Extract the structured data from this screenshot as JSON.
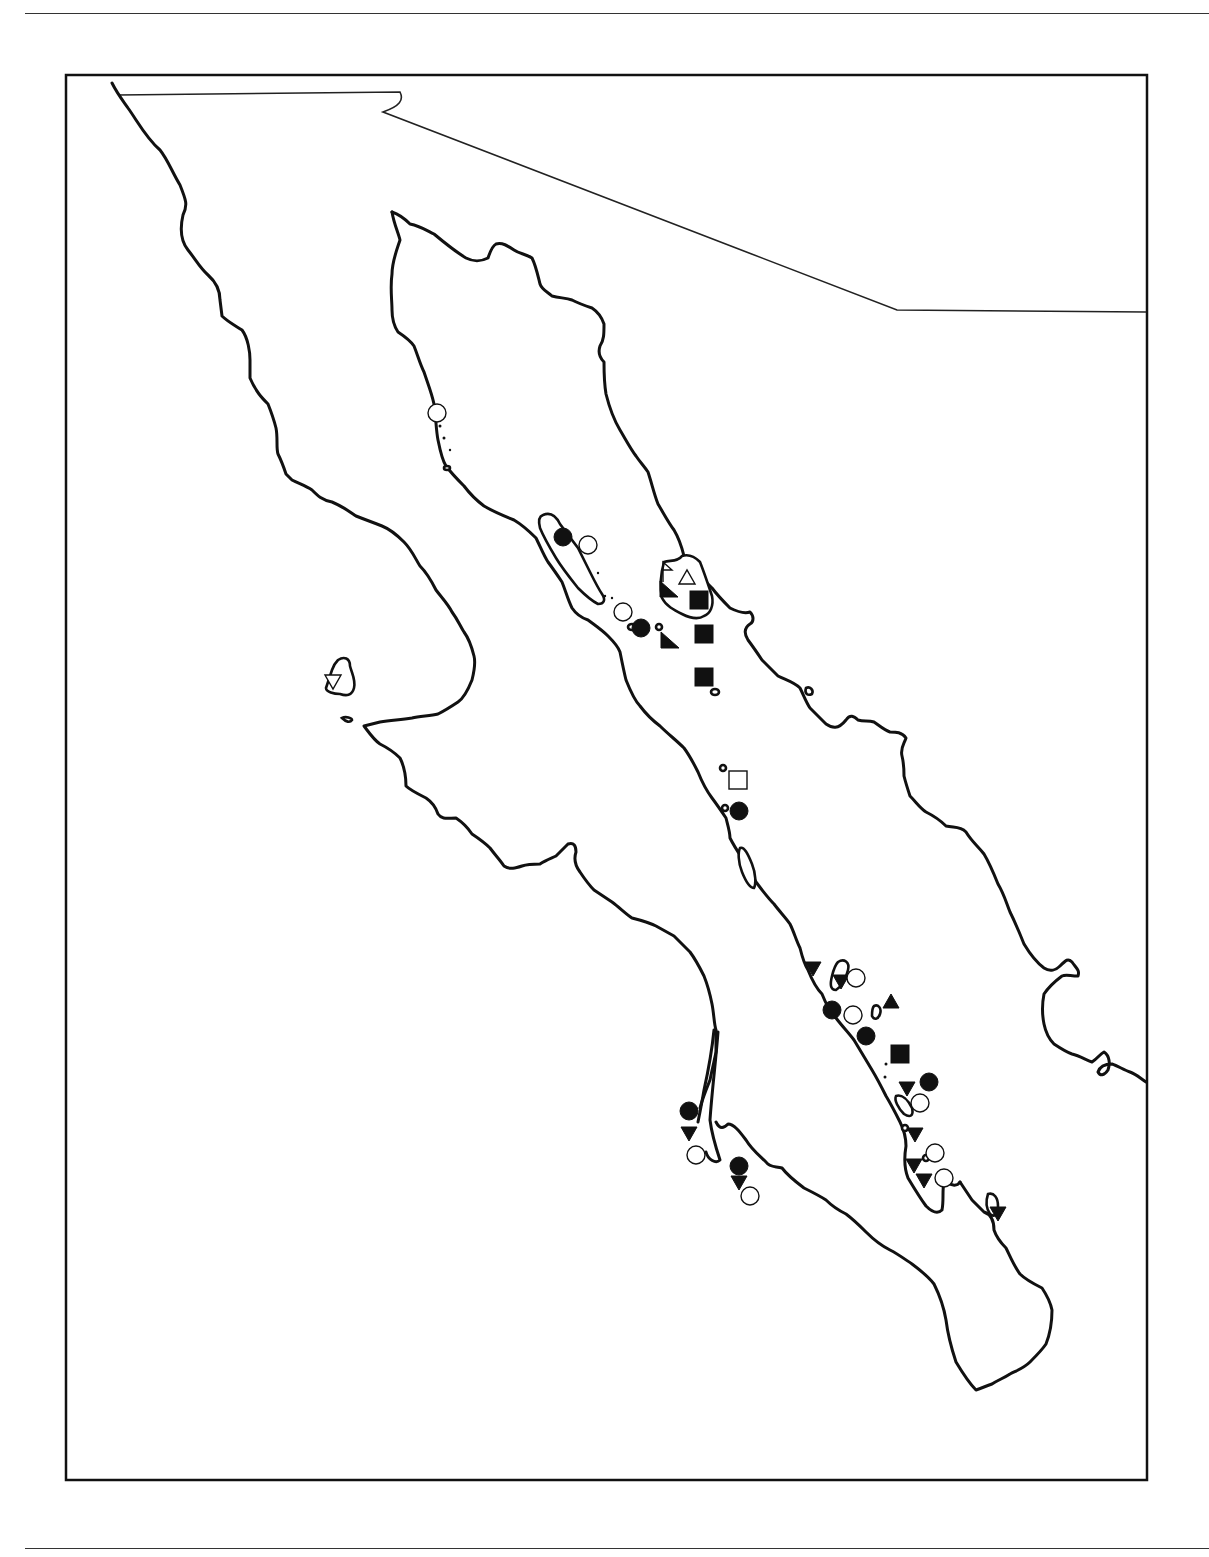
{
  "figure": {
    "type": "distribution-map",
    "region": "Baja California peninsula and Gulf of California",
    "colors": {
      "ink": "#111111",
      "background": "#ffffff"
    }
  },
  "legend_symbols": [
    {
      "id": "filled-circle",
      "glyph": "●"
    },
    {
      "id": "open-circle",
      "glyph": "○"
    },
    {
      "id": "filled-square",
      "glyph": "■"
    },
    {
      "id": "open-square",
      "glyph": "□"
    },
    {
      "id": "filled-triangle",
      "glyph": "▲"
    },
    {
      "id": "open-triangle",
      "glyph": "△"
    },
    {
      "id": "filled-inverted-triangle",
      "glyph": "▼"
    },
    {
      "id": "open-inverted-triangle",
      "glyph": "▽"
    }
  ],
  "markers": [
    {
      "symbol": "open-circle",
      "x": 437,
      "y": 413
    },
    {
      "symbol": "filled-circle",
      "x": 563,
      "y": 537
    },
    {
      "symbol": "open-circle",
      "x": 588,
      "y": 545
    },
    {
      "symbol": "open-square-flag",
      "x": 668,
      "y": 570
    },
    {
      "symbol": "open-triangle",
      "x": 687,
      "y": 578
    },
    {
      "symbol": "filled-triangle-right",
      "x": 667,
      "y": 590
    },
    {
      "symbol": "filled-square",
      "x": 699,
      "y": 600
    },
    {
      "symbol": "open-circle",
      "x": 623,
      "y": 612
    },
    {
      "symbol": "filled-circle",
      "x": 641,
      "y": 628
    },
    {
      "symbol": "filled-triangle-right",
      "x": 668,
      "y": 641
    },
    {
      "symbol": "filled-square",
      "x": 704,
      "y": 634
    },
    {
      "symbol": "filled-square",
      "x": 704,
      "y": 677
    },
    {
      "symbol": "open-inverted-triangle",
      "x": 333,
      "y": 681
    },
    {
      "symbol": "open-square",
      "x": 738,
      "y": 780
    },
    {
      "symbol": "filled-circle",
      "x": 739,
      "y": 811
    },
    {
      "symbol": "filled-inverted-triangle",
      "x": 813,
      "y": 968
    },
    {
      "symbol": "filled-inverted-triangle",
      "x": 841,
      "y": 981
    },
    {
      "symbol": "open-circle",
      "x": 856,
      "y": 978
    },
    {
      "symbol": "filled-triangle",
      "x": 891,
      "y": 1002
    },
    {
      "symbol": "filled-circle",
      "x": 832,
      "y": 1010
    },
    {
      "symbol": "open-circle",
      "x": 853,
      "y": 1015
    },
    {
      "symbol": "filled-circle",
      "x": 866,
      "y": 1036
    },
    {
      "symbol": "filled-square",
      "x": 900,
      "y": 1054
    },
    {
      "symbol": "filled-circle",
      "x": 929,
      "y": 1082
    },
    {
      "symbol": "filled-inverted-triangle",
      "x": 907,
      "y": 1088
    },
    {
      "symbol": "open-circle",
      "x": 920,
      "y": 1103
    },
    {
      "symbol": "filled-inverted-triangle",
      "x": 915,
      "y": 1134
    },
    {
      "symbol": "open-circle",
      "x": 935,
      "y": 1153
    },
    {
      "symbol": "filled-inverted-triangle",
      "x": 914,
      "y": 1165
    },
    {
      "symbol": "filled-inverted-triangle",
      "x": 924,
      "y": 1180
    },
    {
      "symbol": "open-circle",
      "x": 944,
      "y": 1178
    },
    {
      "symbol": "filled-inverted-triangle",
      "x": 998,
      "y": 1213
    },
    {
      "symbol": "filled-circle",
      "x": 689,
      "y": 1111
    },
    {
      "symbol": "filled-inverted-triangle",
      "x": 689,
      "y": 1133
    },
    {
      "symbol": "open-circle",
      "x": 696,
      "y": 1155
    },
    {
      "symbol": "filled-circle",
      "x": 739,
      "y": 1166
    },
    {
      "symbol": "filled-inverted-triangle",
      "x": 739,
      "y": 1182
    },
    {
      "symbol": "open-circle",
      "x": 750,
      "y": 1196
    }
  ]
}
